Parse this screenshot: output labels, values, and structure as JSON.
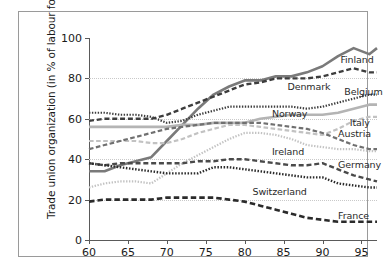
{
  "chart_data": {
    "type": "line",
    "title": "",
    "xlabel": "",
    "ylabel": "Trade union organization (in % of labour force)",
    "xlim": [
      60,
      97
    ],
    "ylim": [
      0,
      100
    ],
    "grid": true,
    "legend_position": "inline-right-labels",
    "xticks": [
      "60",
      "65",
      "70",
      "75",
      "80",
      "85",
      "90",
      "95"
    ],
    "xtick_values": [
      60,
      65,
      70,
      75,
      80,
      85,
      90,
      95
    ],
    "yticks": [
      "0",
      "20",
      "40",
      "60",
      "80",
      "100"
    ],
    "ytick_values": [
      0,
      20,
      40,
      60,
      80,
      100
    ],
    "x": [
      60,
      62,
      64,
      66,
      68,
      70,
      72,
      74,
      76,
      78,
      80,
      82,
      84,
      86,
      88,
      90,
      92,
      94,
      96,
      97
    ],
    "series": [
      {
        "name": "Finland",
        "label": "Finland",
        "style": "solid",
        "color": "#7a7a7a",
        "width": 2.6,
        "label_x": 92.3,
        "label_y": 89.5,
        "values": [
          34,
          34,
          37,
          39,
          41,
          49,
          57,
          65,
          72,
          76,
          79,
          79,
          81,
          81,
          83,
          86,
          91,
          95,
          92,
          95
        ]
      },
      {
        "name": "Denmark",
        "label": "Denmark",
        "style": "dashed",
        "color": "#3d3d3d",
        "width": 2.4,
        "label_x": 85.5,
        "label_y": 76.0,
        "values": [
          59,
          60,
          60,
          60,
          60,
          62,
          65,
          68,
          71,
          74,
          77,
          78,
          80,
          80,
          80,
          81,
          83,
          85,
          83,
          83
        ]
      },
      {
        "name": "Belgium",
        "label": "Belgium",
        "style": "dotted",
        "color": "#3d3d3d",
        "width": 2.2,
        "label_x": 92.8,
        "label_y": 74.0,
        "values": [
          63,
          63,
          62,
          62,
          61,
          58,
          59,
          62,
          64,
          66,
          66,
          66,
          66,
          66,
          65,
          66,
          68,
          70,
          72,
          72
        ]
      },
      {
        "name": "Norway",
        "label": "Norway",
        "style": "solid",
        "color": "#b4b4b4",
        "width": 2.6,
        "label_x": 83.5,
        "label_y": 63.0,
        "values": [
          56,
          56,
          56,
          56,
          56,
          56,
          57,
          57,
          58,
          58,
          58,
          60,
          61,
          62,
          62,
          62,
          63,
          65,
          67,
          67
        ]
      },
      {
        "name": "Italy",
        "label": "Italy",
        "style": "dashed",
        "color": "#c2c2c2",
        "width": 2.2,
        "label_x": 93.5,
        "label_y": 58.5,
        "values": [
          49,
          49,
          49,
          49,
          48,
          48,
          50,
          53,
          55,
          57,
          57,
          56,
          55,
          54,
          53,
          52,
          55,
          59,
          61,
          61
        ]
      },
      {
        "name": "Austria",
        "label": "Austria",
        "style": "dashed",
        "color": "#707070",
        "width": 2.2,
        "label_x": 92.0,
        "label_y": 53.0,
        "values": [
          45,
          47,
          49,
          51,
          53,
          55,
          56,
          57,
          58,
          58,
          58,
          58,
          57,
          56,
          55,
          53,
          50,
          47,
          45,
          45
        ]
      },
      {
        "name": "Ireland",
        "label": "Ireland",
        "style": "dotted",
        "color": "#c2c2c2",
        "width": 2.2,
        "label_x": 83.5,
        "label_y": 44.0,
        "values": [
          26,
          28,
          29,
          29,
          28,
          33,
          38,
          42,
          46,
          50,
          53,
          53,
          52,
          50,
          47,
          46,
          45,
          45,
          44,
          44
        ]
      },
      {
        "name": "Germany",
        "label": "Germany",
        "style": "dashed",
        "color": "#4a4a4a",
        "width": 2.4,
        "label_x": 92.0,
        "label_y": 37.5,
        "values": [
          38,
          37,
          38,
          38,
          38,
          38,
          38,
          39,
          39,
          40,
          40,
          39,
          38,
          37,
          37,
          38,
          35,
          32,
          30,
          29
        ]
      },
      {
        "name": "Switzerland",
        "label": "Switzerland",
        "style": "dotted",
        "color": "#2b2b2b",
        "width": 2.4,
        "label_x": 81.0,
        "label_y": 24.5,
        "values": [
          38,
          37,
          36,
          35,
          34,
          33,
          33,
          33,
          36,
          36,
          35,
          34,
          33,
          32,
          31,
          31,
          28,
          27,
          26,
          26
        ]
      },
      {
        "name": "France",
        "label": "France",
        "style": "dashed",
        "color": "#2b2b2b",
        "width": 2.6,
        "label_x": 92.0,
        "label_y": 12.5,
        "values": [
          19,
          20,
          20,
          20,
          20,
          21,
          21,
          21,
          21,
          20,
          19,
          17,
          15,
          13,
          11,
          10,
          9,
          9,
          9,
          9
        ]
      }
    ]
  }
}
